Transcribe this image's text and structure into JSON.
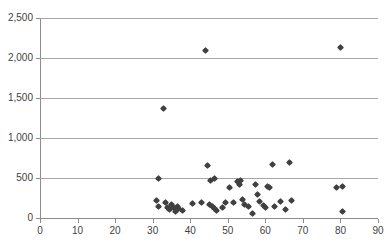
{
  "chart_data": {
    "type": "scatter",
    "title": "",
    "xlabel": "",
    "ylabel": "",
    "xlim": [
      0,
      90
    ],
    "ylim": [
      0,
      2500
    ],
    "grid": true,
    "legend": null,
    "x_ticks": [
      "0",
      "10",
      "20",
      "30",
      "40",
      "50",
      "60",
      "70",
      "80",
      "90"
    ],
    "x_tick_values": [
      0,
      10,
      20,
      30,
      40,
      50,
      60,
      70,
      80,
      90
    ],
    "y_ticks": [
      "0",
      "500",
      "1,000",
      "1,500",
      "2,000",
      "2,500"
    ],
    "y_tick_values": [
      0,
      500,
      1000,
      1500,
      2000,
      2500
    ],
    "marker": {
      "shape": "diamond",
      "color": "#404040",
      "size": 5
    },
    "points": [
      {
        "x": 31.5,
        "y": 500
      },
      {
        "x": 31.0,
        "y": 215
      },
      {
        "x": 31.5,
        "y": 150
      },
      {
        "x": 33.0,
        "y": 1370
      },
      {
        "x": 33.5,
        "y": 200
      },
      {
        "x": 34.0,
        "y": 130
      },
      {
        "x": 34.5,
        "y": 105
      },
      {
        "x": 35.0,
        "y": 175
      },
      {
        "x": 35.5,
        "y": 130
      },
      {
        "x": 36.0,
        "y": 85
      },
      {
        "x": 36.5,
        "y": 150
      },
      {
        "x": 37.0,
        "y": 115
      },
      {
        "x": 38.0,
        "y": 100
      },
      {
        "x": 40.5,
        "y": 185
      },
      {
        "x": 43.0,
        "y": 200
      },
      {
        "x": 44.0,
        "y": 2100
      },
      {
        "x": 44.5,
        "y": 660
      },
      {
        "x": 45.5,
        "y": 470
      },
      {
        "x": 46.5,
        "y": 490
      },
      {
        "x": 45.0,
        "y": 175
      },
      {
        "x": 46.0,
        "y": 150
      },
      {
        "x": 46.5,
        "y": 120
      },
      {
        "x": 47.0,
        "y": 95
      },
      {
        "x": 48.5,
        "y": 130
      },
      {
        "x": 49.5,
        "y": 200
      },
      {
        "x": 50.5,
        "y": 380
      },
      {
        "x": 51.5,
        "y": 200
      },
      {
        "x": 52.5,
        "y": 455
      },
      {
        "x": 53.0,
        "y": 420
      },
      {
        "x": 53.5,
        "y": 470
      },
      {
        "x": 54.0,
        "y": 230
      },
      {
        "x": 54.5,
        "y": 175
      },
      {
        "x": 55.5,
        "y": 150
      },
      {
        "x": 56.5,
        "y": 60
      },
      {
        "x": 57.5,
        "y": 420
      },
      {
        "x": 58.0,
        "y": 290
      },
      {
        "x": 58.5,
        "y": 210
      },
      {
        "x": 59.5,
        "y": 155
      },
      {
        "x": 60.0,
        "y": 130
      },
      {
        "x": 60.5,
        "y": 400
      },
      {
        "x": 61.0,
        "y": 385
      },
      {
        "x": 62.0,
        "y": 665
      },
      {
        "x": 62.5,
        "y": 150
      },
      {
        "x": 64.0,
        "y": 205
      },
      {
        "x": 65.5,
        "y": 110
      },
      {
        "x": 66.5,
        "y": 700
      },
      {
        "x": 67.0,
        "y": 225
      },
      {
        "x": 79.0,
        "y": 385
      },
      {
        "x": 80.5,
        "y": 390
      },
      {
        "x": 80.0,
        "y": 2130
      },
      {
        "x": 80.5,
        "y": 80
      }
    ]
  }
}
